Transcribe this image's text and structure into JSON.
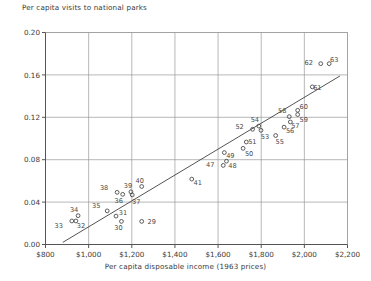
{
  "chart_data": {
    "type": "scatter",
    "title": "Per capita visits to national parks",
    "xlabel": "Per capita disposable income (1963 prices)",
    "ylabel": "Per capita visits to national parks",
    "xlim": [
      800,
      2200
    ],
    "ylim": [
      0.0,
      0.2
    ],
    "xticks": [
      800,
      1000,
      1200,
      1400,
      1600,
      1800,
      2000,
      2200
    ],
    "xticklabels": [
      "$800",
      "$1,000",
      "$1,200",
      "$1,400",
      "$1,600",
      "$1,800",
      "$2,000",
      "$2,200"
    ],
    "yticks": [
      0.0,
      0.04,
      0.08,
      0.12,
      0.16,
      0.2
    ],
    "yticklabels": [
      "0.00",
      "0.04",
      "0.08",
      "0.12",
      "0.16",
      "0.20"
    ],
    "grid": true,
    "legend": null,
    "marker": "open-circle",
    "trendline": {
      "x0": 880,
      "y0": 0.002,
      "x1": 2165,
      "y1": 0.159
    },
    "points": [
      {
        "label": "29",
        "x": 1246,
        "y": 0.0218,
        "lx": 10,
        "ly": 3
      },
      {
        "label": "30",
        "x": 1152,
        "y": 0.0218,
        "lx": -3,
        "ly": 9
      },
      {
        "label": "31",
        "x": 1127,
        "y": 0.0268,
        "lx": 7,
        "ly": -1
      },
      {
        "label": "32",
        "x": 941,
        "y": 0.0222,
        "lx": 5,
        "ly": 7
      },
      {
        "label": "33",
        "x": 922,
        "y": 0.0222,
        "lx": -13,
        "ly": 7
      },
      {
        "label": "34",
        "x": 951,
        "y": 0.0272,
        "lx": -4,
        "ly": -4
      },
      {
        "label": "35",
        "x": 1086,
        "y": 0.0317,
        "lx": -11,
        "ly": -3
      },
      {
        "label": "36",
        "x": 1158,
        "y": 0.0473,
        "lx": -4,
        "ly": 9
      },
      {
        "label": "37",
        "x": 1202,
        "y": 0.0468,
        "lx": 4,
        "ly": 9
      },
      {
        "label": "38",
        "x": 1132,
        "y": 0.0492,
        "lx": -13,
        "ly": -2
      },
      {
        "label": "39",
        "x": 1196,
        "y": 0.0497,
        "lx": -3,
        "ly": -4
      },
      {
        "label": "40",
        "x": 1246,
        "y": 0.0547,
        "lx": -2,
        "ly": -4
      },
      {
        "label": "41",
        "x": 1478,
        "y": 0.0617,
        "lx": 6,
        "ly": 6
      },
      {
        "label": "47",
        "x": 1624,
        "y": 0.0746,
        "lx": -13,
        "ly": 2
      },
      {
        "label": "48",
        "x": 1639,
        "y": 0.0786,
        "lx": 6,
        "ly": 7
      },
      {
        "label": "49",
        "x": 1629,
        "y": 0.0867,
        "lx": 6,
        "ly": 5
      },
      {
        "label": "50",
        "x": 1716,
        "y": 0.0907,
        "lx": 6,
        "ly": 8
      },
      {
        "label": "51",
        "x": 1731,
        "y": 0.0967,
        "lx": 6,
        "ly": 2
      },
      {
        "label": "52",
        "x": 1760,
        "y": 0.1087,
        "lx": -13,
        "ly": 0
      },
      {
        "label": "53",
        "x": 1799,
        "y": 0.1077,
        "lx": 4,
        "ly": 9
      },
      {
        "label": "54",
        "x": 1789,
        "y": 0.1117,
        "lx": -4,
        "ly": -4
      },
      {
        "label": "55",
        "x": 1867,
        "y": 0.1028,
        "lx": 4,
        "ly": 8
      },
      {
        "label": "56",
        "x": 1906,
        "y": 0.1107,
        "lx": 6,
        "ly": 6
      },
      {
        "label": "57",
        "x": 1935,
        "y": 0.1156,
        "lx": 5,
        "ly": 6
      },
      {
        "label": "58",
        "x": 1930,
        "y": 0.1206,
        "lx": -7,
        "ly": -4
      },
      {
        "label": "59",
        "x": 1969,
        "y": 0.1226,
        "lx": 6,
        "ly": 7
      },
      {
        "label": "60",
        "x": 1969,
        "y": 0.1266,
        "lx": 6,
        "ly": -1
      },
      {
        "label": "61",
        "x": 2037,
        "y": 0.1487,
        "lx": 5,
        "ly": 3
      },
      {
        "label": "62",
        "x": 2076,
        "y": 0.1706,
        "lx": -12,
        "ly": 1
      },
      {
        "label": "63",
        "x": 2115,
        "y": 0.1706,
        "lx": 5,
        "ly": -2
      }
    ]
  },
  "colors": {
    "axis": "#555555",
    "grid": "#9a9a9a",
    "marker": "#4a4a4a",
    "text": "#3a3a3a",
    "trendline": "#3f3f3f",
    "background": "#ffffff"
  }
}
